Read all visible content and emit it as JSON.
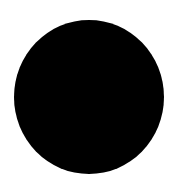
{
  "canvas": {
    "background": "#ffffff",
    "width": 177,
    "height": 194
  },
  "shape": {
    "type": "circle",
    "fill": "#000000",
    "left": 14,
    "top": 20,
    "width": 150,
    "height": 154
  }
}
